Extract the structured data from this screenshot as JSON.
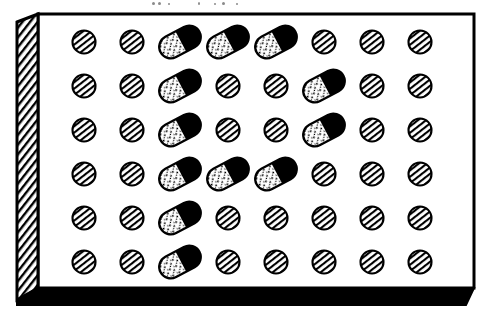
{
  "figure": {
    "style": "black-and-white line art",
    "background_color": "#ffffff",
    "ink_color": "#000000"
  },
  "tray": {
    "name": "tray",
    "shape": "rectangular box in slight perspective",
    "outline_color": "#000000",
    "outline_width_px": 3,
    "interior_color": "#ffffff",
    "side_wall": {
      "name": "left-side-wall",
      "fill": "diagonal-hatch",
      "hatch_direction": "lower-left to upper-right",
      "hatch_color": "#000000",
      "width_px": 22
    },
    "front_edge": {
      "name": "front-edge",
      "fill": "solid",
      "color": "#000000",
      "height_px": 17,
      "tapered_right": true
    }
  },
  "grid": {
    "rows": 6,
    "columns": 8,
    "origin_x": 84,
    "origin_y": 42,
    "step_x": 48,
    "step_y": 44,
    "total_items": 48
  },
  "legend": {
    "tablet_label": "hatched tablet",
    "capsule_label": "two-tone capsule"
  },
  "items": {
    "tablet": {
      "name": "tablet",
      "shape": "circle",
      "diameter_px": 23,
      "fill": "diagonal-hatch",
      "hatch_direction": "lower-left to upper-right",
      "outline_color": "#000000",
      "count": 37
    },
    "capsule": {
      "name": "capsule",
      "shape": "rounded rectangle",
      "length_px": 44,
      "thickness_px": 23,
      "rotation_deg": -28,
      "cap_color": "#000000",
      "body_color": "#ffffff",
      "body_texture": "speckled",
      "outline_color": "#000000",
      "count": 11
    }
  },
  "layout": {
    "rows": [
      {
        "index": 1,
        "cells": [
          "tablet",
          "tablet",
          "capsule",
          "capsule",
          "capsule",
          "tablet",
          "tablet",
          "tablet"
        ]
      },
      {
        "index": 2,
        "cells": [
          "tablet",
          "tablet",
          "capsule",
          "tablet",
          "tablet",
          "capsule",
          "tablet",
          "tablet"
        ]
      },
      {
        "index": 3,
        "cells": [
          "tablet",
          "tablet",
          "capsule",
          "tablet",
          "tablet",
          "capsule",
          "tablet",
          "tablet"
        ]
      },
      {
        "index": 4,
        "cells": [
          "tablet",
          "tablet",
          "capsule",
          "capsule",
          "capsule",
          "tablet",
          "tablet",
          "tablet"
        ]
      },
      {
        "index": 5,
        "cells": [
          "tablet",
          "tablet",
          "capsule",
          "tablet",
          "tablet",
          "tablet",
          "tablet",
          "tablet"
        ]
      },
      {
        "index": 6,
        "cells": [
          "tablet",
          "tablet",
          "capsule",
          "tablet",
          "tablet",
          "tablet",
          "tablet",
          "tablet"
        ]
      }
    ]
  },
  "counts": {
    "tablets": 37,
    "capsules": 11,
    "total": 48
  },
  "top_artifacts": {
    "name": "scan-artifacts",
    "description": "faint cropped ink marks at the top edge of the scan",
    "marks": [
      {
        "x": 152,
        "y": 2,
        "w": 3,
        "h": 3
      },
      {
        "x": 158,
        "y": 2,
        "w": 3,
        "h": 3
      },
      {
        "x": 168,
        "y": 3,
        "w": 2,
        "h": 2
      },
      {
        "x": 198,
        "y": 2,
        "w": 2,
        "h": 3
      },
      {
        "x": 214,
        "y": 3,
        "w": 2,
        "h": 2
      },
      {
        "x": 222,
        "y": 2,
        "w": 3,
        "h": 3
      },
      {
        "x": 236,
        "y": 3,
        "w": 2,
        "h": 2
      }
    ]
  }
}
